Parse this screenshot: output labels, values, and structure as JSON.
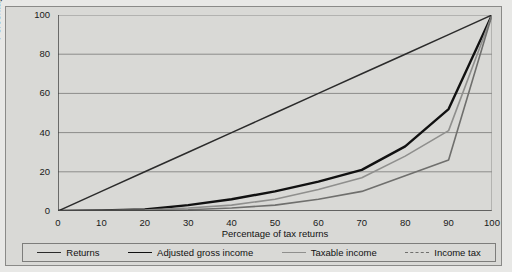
{
  "chart_data": {
    "type": "line",
    "title": "",
    "xlabel": "Percentage of tax returns",
    "ylabel": "Percentage of personal income",
    "xlim": [
      0,
      100
    ],
    "ylim": [
      0,
      100
    ],
    "xticks": [
      0,
      10,
      20,
      30,
      40,
      50,
      60,
      70,
      80,
      90,
      100
    ],
    "yticks": [
      0,
      20,
      40,
      60,
      80,
      100
    ],
    "grid": "horizontal",
    "legend_position": "bottom",
    "series": [
      {
        "name": "Returns",
        "color": "#2b2b2b",
        "width": 1.5,
        "style": "solid",
        "x": [
          0,
          10,
          20,
          30,
          40,
          50,
          60,
          70,
          80,
          90,
          100
        ],
        "y": [
          0,
          10,
          20,
          30,
          40,
          50,
          60,
          70,
          80,
          90,
          100
        ]
      },
      {
        "name": "Adjusted gross income",
        "color": "#111111",
        "width": 2.4,
        "style": "solid",
        "x": [
          0,
          10,
          20,
          30,
          40,
          50,
          60,
          70,
          80,
          90,
          100
        ],
        "y": [
          0,
          0.3,
          0.8,
          3,
          6,
          10,
          15,
          21,
          33,
          52,
          100
        ]
      },
      {
        "name": "Taxable income",
        "color": "#8f8f8d",
        "width": 1.6,
        "style": "solid",
        "x": [
          0,
          10,
          20,
          30,
          40,
          50,
          60,
          70,
          80,
          90,
          100
        ],
        "y": [
          0,
          0.2,
          0.5,
          1.5,
          3,
          6,
          11,
          17,
          28,
          41,
          100
        ]
      },
      {
        "name": "Income tax",
        "color": "#6f6f6d",
        "width": 1.6,
        "style": "solid",
        "x": [
          0,
          10,
          20,
          30,
          40,
          50,
          60,
          70,
          80,
          90,
          100
        ],
        "y": [
          0,
          0.1,
          0.2,
          0.6,
          1.5,
          3,
          6,
          10,
          18,
          26,
          100
        ]
      }
    ]
  },
  "axes": {
    "y_title": "Percentage of personal income",
    "x_title": "Percentage of tax returns",
    "y_tick_labels": [
      "100",
      "80",
      "60",
      "40",
      "20",
      "0"
    ],
    "x_tick_labels": [
      "0",
      "10",
      "20",
      "30",
      "40",
      "50",
      "60",
      "70",
      "80",
      "90",
      "100"
    ]
  },
  "legend": {
    "items": [
      {
        "label": "Returns",
        "color": "#2b2b2b",
        "style": "solid"
      },
      {
        "label": "Adjusted gross income",
        "color": "#111111",
        "style": "solid"
      },
      {
        "label": "Taxable income",
        "color": "#8f8f8d",
        "style": "solid"
      },
      {
        "label": "Income tax",
        "color": "#6f6f6d",
        "style": "dashed"
      }
    ]
  },
  "colors": {
    "figure_background": "#e8e8e6",
    "panel_background": "#d9d9d6",
    "grid": "#8c8c8a",
    "axis": "#3a3a3a",
    "text": "#111111"
  }
}
